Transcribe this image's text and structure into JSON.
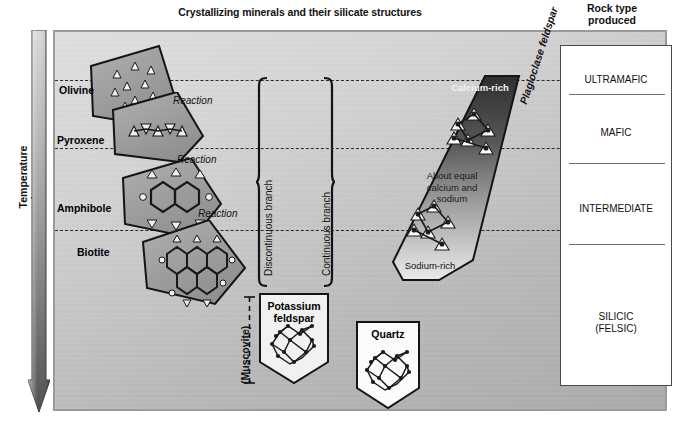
{
  "title": "Crystallizing minerals and their silicate structures",
  "rock_column": {
    "header_line1": "Rock type",
    "header_line2": "produced",
    "entries": [
      {
        "label": "ULTRAMAFIC"
      },
      {
        "label": "MAFIC"
      },
      {
        "label": "INTERMEDIATE"
      },
      {
        "label": "SILICIC",
        "label2": "(FELSIC)"
      }
    ]
  },
  "temperature": {
    "axis_label": "Temperature decreases",
    "direction": "downward"
  },
  "discontinuous_branch": {
    "label": "Discontinuous branch",
    "minerals": [
      {
        "name": "Olivine",
        "structure": "isolated-tetrahedra"
      },
      {
        "name": "Pyroxene",
        "structure": "single-chain"
      },
      {
        "name": "Amphibole",
        "structure": "double-chain"
      },
      {
        "name": "Biotite",
        "structure": "sheet"
      }
    ],
    "reactions": [
      "Reaction",
      "Reaction",
      "Reaction"
    ]
  },
  "continuous_branch": {
    "label": "Continuous branch",
    "series_name": "Plagioclase feldspar",
    "top_label": "Calcium-rich",
    "middle_label_line1": "About equal",
    "middle_label_line2": "calcium and",
    "middle_label_line3": "sodium",
    "bottom_label": "Sodium-rich"
  },
  "late_minerals": {
    "muscovite": "(Muscovite)",
    "potassium_feldspar_line1": "Potassium",
    "potassium_feldspar_line2": "feldspar",
    "quartz": "Quartz"
  },
  "colors": {
    "panel_light": "#e0e0e0",
    "panel_dark": "#ababab",
    "mineral_gray": "#9d9d9d",
    "outline": "#1a1a1a",
    "white_box": "#ffffff",
    "plagioclase_dark": "#3d3d3d",
    "plagioclase_light": "#e8e8e8"
  }
}
